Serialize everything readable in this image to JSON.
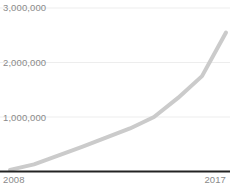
{
  "chart_data": {
    "type": "line",
    "title": "",
    "subtitle": "",
    "xlabel": "",
    "ylabel": "",
    "x": [
      2008,
      2009,
      2010,
      2011,
      2012,
      2013,
      2014,
      2015,
      2016,
      2017
    ],
    "series": [
      {
        "name": "total",
        "values": [
          30000,
          130000,
          290000,
          450000,
          620000,
          790000,
          1000000,
          1350000,
          1750000,
          2550000
        ]
      }
    ],
    "xlim": [
      2008,
      2017
    ],
    "ylim": [
      0,
      3000000
    ],
    "ytick_values": [
      3000000,
      2000000,
      1000000
    ],
    "ytick_labels": [
      "3,000,000",
      "2,000,000",
      "1,000,000"
    ],
    "xtick_values": [
      2008,
      2017
    ],
    "xtick_labels": [
      "2008",
      "2017"
    ],
    "grid": true,
    "grid_axis": "y",
    "legend": false,
    "legend_position": "none",
    "colors": {
      "line": "#cbcbcb",
      "grid": "#ededed",
      "axis": "#222222",
      "tick_text": "#8a8a8a",
      "background": "#ffffff"
    },
    "line_width": 4
  },
  "axes": {
    "y_labels": {
      "top": "3,000,000",
      "middle": "2,000,000",
      "bottom": "1,000,000"
    },
    "x_labels": {
      "start": "2008",
      "end": "2017"
    }
  }
}
